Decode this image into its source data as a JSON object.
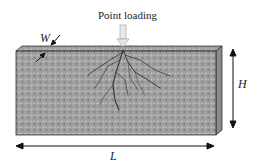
{
  "diagram": {
    "title_label": "Point loading",
    "dimensions": {
      "width_label": "W",
      "height_label": "H",
      "length_label": "L"
    },
    "colors": {
      "specimen_fill": "#9a9a9a",
      "crack": "#3a3a3a",
      "arrow": "#111111",
      "load_arrow": "#cccccc"
    }
  }
}
